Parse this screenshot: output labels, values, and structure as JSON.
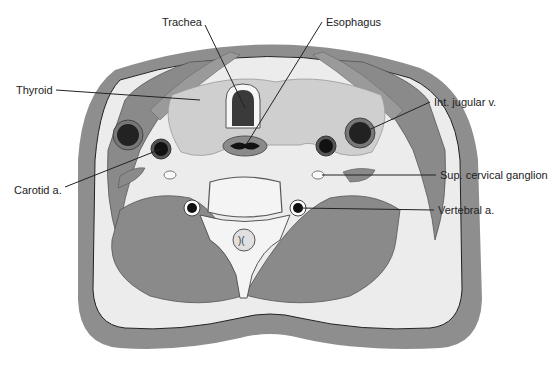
{
  "figure": {
    "labels": {
      "trachea": "Trachea",
      "esophagus": "Esophagus",
      "thyroid": "Thyroid",
      "int_jugular": "Int. jugular v.",
      "carotid": "Carotid a.",
      "sup_cervical": "Sup. cervical ganglion",
      "vertebral": "Vertebral a."
    },
    "colors": {
      "skin": "#8e8e8e",
      "fat": "#ececec",
      "muscle": "#8a8a8a",
      "thyroid": "#cfcfcf",
      "vessel": "#2a2a2a",
      "bone": "#f4f4f4"
    }
  }
}
